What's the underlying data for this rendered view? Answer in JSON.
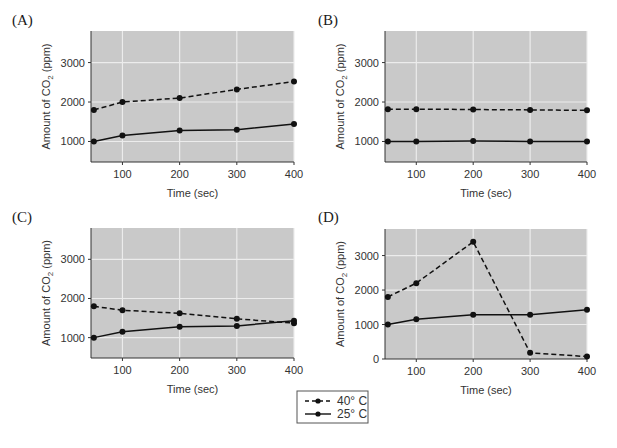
{
  "chart_data": [
    {
      "panel": "(A)",
      "type": "line",
      "x": [
        50,
        100,
        200,
        300,
        400
      ],
      "xticks": [
        100,
        200,
        300,
        400
      ],
      "yticks": [
        1000,
        2000,
        3000
      ],
      "xlabel": "Time (sec)",
      "ylabel": "Amount of CO2 (ppm)",
      "ylim": [
        480,
        3800
      ],
      "xlim": [
        45,
        400
      ],
      "grid": true,
      "series": [
        {
          "name": "40° C",
          "style": "dashed",
          "values": [
            1800,
            2000,
            2100,
            2320,
            2520
          ]
        },
        {
          "name": "25° C",
          "style": "solid",
          "values": [
            1000,
            1150,
            1280,
            1300,
            1440
          ]
        }
      ]
    },
    {
      "panel": "(B)",
      "type": "line",
      "x": [
        50,
        100,
        200,
        300,
        400
      ],
      "xticks": [
        100,
        200,
        300,
        400
      ],
      "yticks": [
        1000,
        2000,
        3000
      ],
      "xlabel": "Time (sec)",
      "ylabel": "Amount of CO2 (ppm)",
      "ylim": [
        480,
        3800
      ],
      "xlim": [
        45,
        400
      ],
      "grid": true,
      "series": [
        {
          "name": "40° C",
          "style": "dashed",
          "values": [
            1820,
            1820,
            1810,
            1800,
            1790
          ]
        },
        {
          "name": "25° C",
          "style": "solid",
          "values": [
            1000,
            1000,
            1010,
            1000,
            1000
          ]
        }
      ]
    },
    {
      "panel": "(C)",
      "type": "line",
      "x": [
        50,
        100,
        200,
        300,
        400
      ],
      "xticks": [
        100,
        200,
        300,
        400
      ],
      "yticks": [
        1000,
        2000,
        3000
      ],
      "xlabel": "Time (sec)",
      "ylabel": "Amount of CO2 (ppm)",
      "ylim": [
        480,
        3800
      ],
      "xlim": [
        45,
        400
      ],
      "grid": true,
      "series": [
        {
          "name": "40° C",
          "style": "dashed",
          "values": [
            1800,
            1700,
            1620,
            1480,
            1370
          ]
        },
        {
          "name": "25° C",
          "style": "solid",
          "values": [
            1000,
            1150,
            1280,
            1300,
            1430
          ]
        }
      ]
    },
    {
      "panel": "(D)",
      "type": "line",
      "x": [
        50,
        100,
        200,
        300,
        400
      ],
      "xticks": [
        100,
        200,
        300,
        400
      ],
      "yticks": [
        0,
        1000,
        2000,
        3000
      ],
      "xlabel": "Time (sec)",
      "ylabel": "Amount of CO2 (ppm)",
      "ylim": [
        0,
        3770
      ],
      "xlim": [
        45,
        400
      ],
      "grid": true,
      "series": [
        {
          "name": "40° C",
          "style": "dashed",
          "values": [
            1800,
            2200,
            3400,
            180,
            70
          ]
        },
        {
          "name": "25° C",
          "style": "solid",
          "values": [
            1000,
            1150,
            1280,
            1280,
            1430
          ]
        }
      ]
    }
  ],
  "legend": {
    "items": [
      {
        "label": "40° C",
        "style": "dashed"
      },
      {
        "label": "25° C",
        "style": "solid"
      }
    ]
  },
  "colors": {
    "plot_bg": "#c9c9c9",
    "grid": "#ececec",
    "line": "#111111"
  }
}
